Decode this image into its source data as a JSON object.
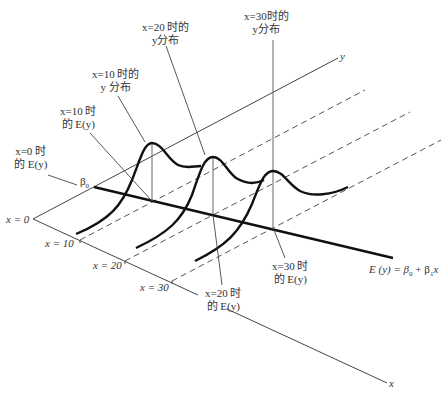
{
  "diagram": {
    "type": "3d-regression-illustration",
    "axes": {
      "x_label": "x",
      "y_label": "y"
    },
    "x_ticks": [
      {
        "label": "x = 0"
      },
      {
        "label": "x = 10"
      },
      {
        "label": "x = 20"
      },
      {
        "label": "x = 30"
      }
    ],
    "intercept_label": "β",
    "intercept_sub": "0",
    "regression_equation": {
      "lhs": "E (y) = β",
      "sub0": "0",
      "mid": " + β",
      "sub1": "1",
      "rhs": "x"
    },
    "callouts": {
      "x0_ey": {
        "line1": "x=0 时",
        "line2": "的 E(y)"
      },
      "x10_ey": {
        "line1": "x=10 时",
        "line2": "的 E(y)"
      },
      "x10_dist": {
        "line1": "x=10 时的",
        "line2": "y 分布"
      },
      "x20_dist": {
        "line1": "x=20 时的",
        "line2": "y分布"
      },
      "x30_dist": {
        "line1": "x=30时的",
        "line2": "y分布"
      },
      "x20_ey": {
        "line1": "x=20 时",
        "line2": "的 E(y)"
      },
      "x30_ey": {
        "line1": "x=30 时",
        "line2": "的 E(y)"
      }
    },
    "colors": {
      "axis": "#444444",
      "curve": "#111111",
      "dashed": "#555555",
      "text": "#333333"
    }
  }
}
